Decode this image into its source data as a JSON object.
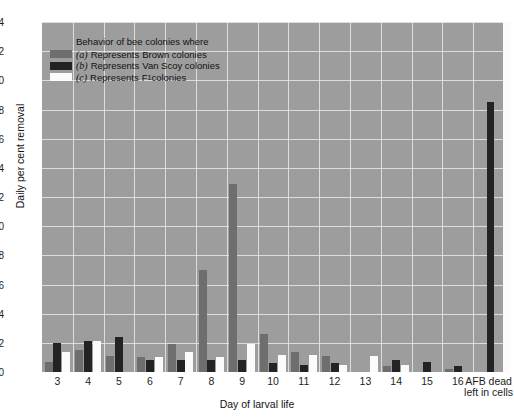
{
  "chart_data": {
    "type": "bar",
    "title": "",
    "xlabel": "Day of larval life",
    "ylabel": "Daily per cent removal",
    "ylim": [
      0,
      24
    ],
    "ytick_step": 2,
    "yticks": [
      "0",
      "2",
      "4",
      "6",
      "8",
      "10",
      "12",
      "14",
      "16",
      "18",
      "20",
      "22",
      "24"
    ],
    "grid": true,
    "legend_position": "upper-left-inside",
    "plot_background": "#9d9d9d",
    "categories": [
      "3",
      "4",
      "5",
      "6",
      "7",
      "8",
      "9",
      "10",
      "11",
      "12",
      "13",
      "14",
      "15",
      "16",
      "AFB dead\nleft in cells"
    ],
    "category_labels": [
      {
        "line1": "3",
        "line2": ""
      },
      {
        "line1": "4",
        "line2": ""
      },
      {
        "line1": "5",
        "line2": ""
      },
      {
        "line1": "6",
        "line2": ""
      },
      {
        "line1": "7",
        "line2": ""
      },
      {
        "line1": "8",
        "line2": ""
      },
      {
        "line1": "9",
        "line2": ""
      },
      {
        "line1": "10",
        "line2": ""
      },
      {
        "line1": "11",
        "line2": ""
      },
      {
        "line1": "12",
        "line2": ""
      },
      {
        "line1": "13",
        "line2": ""
      },
      {
        "line1": "14",
        "line2": ""
      },
      {
        "line1": "15",
        "line2": ""
      },
      {
        "line1": "16",
        "line2": ""
      },
      {
        "line1": "AFB dead",
        "line2": "left in cells"
      }
    ],
    "series": [
      {
        "name": "Brown colonies",
        "key": "a",
        "color": "#6e6e6e",
        "values": [
          0.7,
          1.5,
          1.1,
          1.0,
          1.9,
          7.0,
          12.9,
          2.6,
          1.4,
          1.1,
          0.0,
          0.4,
          0.0,
          0.2,
          0.0
        ]
      },
      {
        "name": "Van Scoy colonies",
        "key": "b",
        "color": "#232323",
        "values": [
          2.0,
          2.1,
          2.4,
          0.8,
          0.8,
          0.8,
          0.8,
          0.6,
          0.5,
          0.6,
          0.0,
          0.8,
          0.7,
          0.4,
          18.5
        ]
      },
      {
        "name": "F1 colonies",
        "key": "c",
        "color": "#fbfbfb",
        "values": [
          1.4,
          2.1,
          0.0,
          1.0,
          1.4,
          1.0,
          1.9,
          1.2,
          1.2,
          0.5,
          1.1,
          0.5,
          0.0,
          0.0,
          24.0
        ]
      }
    ]
  },
  "legend": {
    "title": "Behavior of bee colonies where",
    "entries": [
      {
        "key": "(a)",
        "verb": "Represents",
        "name": "Brown colonies",
        "sub": ""
      },
      {
        "key": "(b)",
        "verb": "Represents",
        "name": "Van Scoy colonies",
        "sub": ""
      },
      {
        "key": "(c)",
        "verb": "Represents",
        "name": "F",
        "sub": "1",
        "name_tail": " colonies"
      }
    ]
  },
  "axes": {
    "y_title": "Daily per cent removal",
    "x_title": "Day of larval life"
  },
  "caption": {
    "text": ""
  }
}
